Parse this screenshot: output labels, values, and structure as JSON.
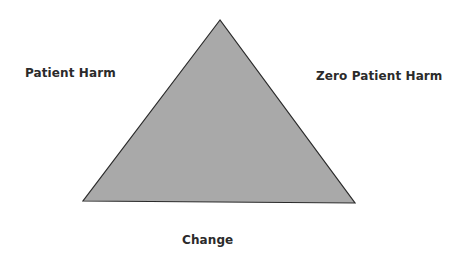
{
  "diagram": {
    "shape": "triangle",
    "fill_color": "#a9a9a9",
    "stroke_color": "#2a2a2a",
    "vertices": {
      "apex": [
        220,
        20
      ],
      "bottom_left": [
        83,
        201
      ],
      "bottom_right": [
        355,
        203
      ]
    },
    "labels": {
      "left": "Patient Harm",
      "right": "Zero Patient Harm",
      "bottom": "Change"
    }
  }
}
